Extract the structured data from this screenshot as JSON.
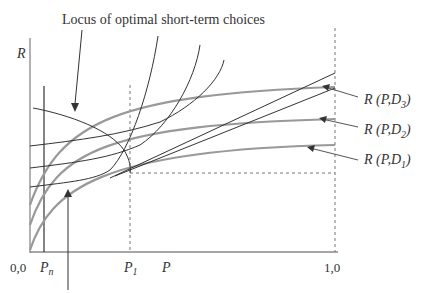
{
  "title": "Locus of optimal short-term choices",
  "axes": {
    "y_label": "R",
    "x_label": "P",
    "origin_label": "0,0",
    "x_end_label": "1,0",
    "p_n_label": "P",
    "p_n_sub": "n",
    "p_1_label": "P",
    "p_1_sub": "1"
  },
  "curves": [
    {
      "name": "R (P,D3)",
      "prefix": "R (P,D",
      "sub": "3",
      "suffix": ")"
    },
    {
      "name": "R (P,D2)",
      "prefix": "R (P,D",
      "sub": "2",
      "suffix": ")"
    },
    {
      "name": "R (P,D1)",
      "prefix": "R (P,D",
      "sub": "1",
      "suffix": ")"
    }
  ],
  "colors": {
    "gray_curve": "#999999",
    "black_curve": "#333333",
    "dashed": "#777777"
  }
}
